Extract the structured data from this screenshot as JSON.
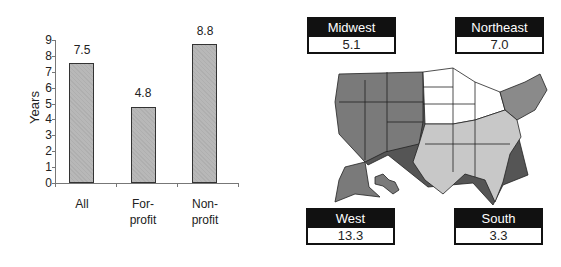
{
  "chart_data": [
    {
      "type": "bar",
      "title": "",
      "xlabel": "",
      "ylabel": "Years",
      "ylim": [
        0,
        9
      ],
      "yticks": [
        0,
        1,
        2,
        3,
        4,
        5,
        6,
        7,
        8,
        9
      ],
      "categories": [
        "All",
        "For-profit",
        "Non-profit"
      ],
      "values": [
        7.5,
        4.8,
        8.8
      ],
      "value_labels": [
        "7.5",
        "4.8",
        "8.8"
      ],
      "grid": false
    },
    {
      "type": "map",
      "title": "",
      "regions": [
        {
          "name": "Midwest",
          "value": 5.1,
          "label": "5.1"
        },
        {
          "name": "Northeast",
          "value": 7.0,
          "label": "7.0"
        },
        {
          "name": "West",
          "value": 13.3,
          "label": "13.3"
        },
        {
          "name": "South",
          "value": 3.3,
          "label": "3.3"
        }
      ]
    }
  ],
  "labels": {
    "ylabel": "Years",
    "cats": [
      "All",
      "For-",
      "profit",
      "Non-",
      "profit"
    ]
  },
  "colors": {
    "bar": "#b8b8b8",
    "west": "#7a7a7a",
    "northeast": "#8a8a8a",
    "south": "#c8c8c8",
    "midwest": "#ffffff"
  }
}
